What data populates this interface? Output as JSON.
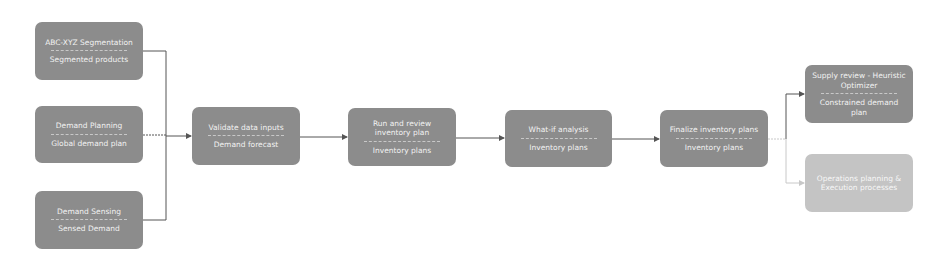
{
  "colors": {
    "node_fill": "#8c8c8c",
    "node_fill_secondary": "#c4c4c4",
    "node_text": "#f2f2f2",
    "edge": "#555555",
    "edge_secondary": "#c8c8c8"
  },
  "nodes": [
    {
      "id": "abc-xyz",
      "title": "ABC-XYZ Segmentation",
      "output": "Segmented products"
    },
    {
      "id": "demand-planning",
      "title": "Demand Planning",
      "output": "Global demand plan"
    },
    {
      "id": "demand-sensing",
      "title": "Demand Sensing",
      "output": "Sensed Demand"
    },
    {
      "id": "validate",
      "title": "Validate data inputs",
      "output": "Demand forecast"
    },
    {
      "id": "run-review",
      "title": "Run and review inventory plan",
      "output": "Inventory plans"
    },
    {
      "id": "what-if",
      "title": "What-if analysis",
      "output": "Inventory plans"
    },
    {
      "id": "finalize",
      "title": "Finalize inventory plans",
      "output": "Inventory plans"
    },
    {
      "id": "supply-review",
      "title": "Supply review - Heuristic Optimizer",
      "output": "Constrained demand plan"
    },
    {
      "id": "operations",
      "title": "Operations planning & Execution processes",
      "output": ""
    }
  ],
  "edges": [
    {
      "from": "abc-xyz",
      "to": "validate"
    },
    {
      "from": "demand-planning",
      "to": "validate"
    },
    {
      "from": "demand-sensing",
      "to": "validate"
    },
    {
      "from": "validate",
      "to": "run-review"
    },
    {
      "from": "run-review",
      "to": "what-if"
    },
    {
      "from": "what-if",
      "to": "finalize"
    },
    {
      "from": "finalize",
      "to": "supply-review"
    },
    {
      "from": "finalize",
      "to": "operations"
    }
  ]
}
